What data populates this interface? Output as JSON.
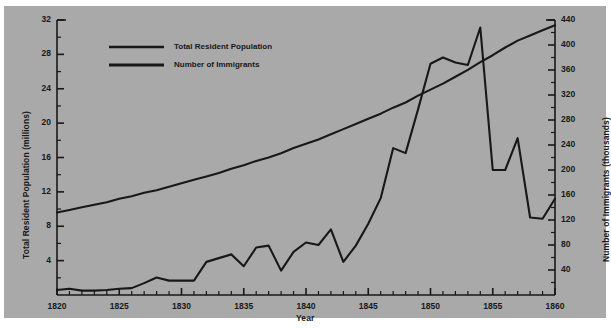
{
  "figure": {
    "background_color": "#ffffff",
    "plate_color": "#a9a9a9",
    "ink_color": "#18181a"
  },
  "chart_data": {
    "type": "line",
    "title": "",
    "xlabel": "Year",
    "ylabel": "Total Resident Population (millions)",
    "y2label": "Number of Immigrants (thousands)",
    "xlim": [
      1820,
      1860
    ],
    "ylim": [
      0,
      32
    ],
    "y2lim": [
      0,
      440
    ],
    "xticks": [
      1820,
      1825,
      1830,
      1835,
      1840,
      1845,
      1850,
      1855,
      1860
    ],
    "xtick_labels": [
      "1820",
      "1825",
      "1830",
      "1835",
      "1840",
      "1845",
      "1850",
      "1855",
      "1860"
    ],
    "xminor_step": 1,
    "yticks": [
      4,
      8,
      12,
      16,
      20,
      24,
      28,
      32
    ],
    "ytick_labels": [
      "4",
      "8",
      "12",
      "16",
      "20",
      "24",
      "28",
      "32"
    ],
    "yminor_step": 2,
    "y2ticks": [
      40,
      80,
      120,
      160,
      200,
      240,
      280,
      320,
      360,
      400,
      440
    ],
    "y2tick_labels": [
      "40",
      "80",
      "120",
      "160",
      "200",
      "240",
      "280",
      "320",
      "360",
      "400",
      "440"
    ],
    "y2minor_step": 20,
    "grid": false,
    "legend_position": "upper-left-inside",
    "x": [
      1820,
      1821,
      1822,
      1823,
      1824,
      1825,
      1826,
      1827,
      1828,
      1829,
      1830,
      1831,
      1832,
      1833,
      1834,
      1835,
      1836,
      1837,
      1838,
      1839,
      1840,
      1841,
      1842,
      1843,
      1844,
      1845,
      1846,
      1847,
      1848,
      1849,
      1850,
      1851,
      1852,
      1853,
      1854,
      1855,
      1856,
      1857,
      1858,
      1859,
      1860
    ],
    "series": [
      {
        "name": "Total Resident Population",
        "axis": "left",
        "unit": "millions",
        "values": [
          9.6,
          9.9,
          10.2,
          10.5,
          10.8,
          11.2,
          11.5,
          11.9,
          12.2,
          12.6,
          13.0,
          13.4,
          13.8,
          14.2,
          14.7,
          15.1,
          15.6,
          16.0,
          16.5,
          17.1,
          17.6,
          18.1,
          18.7,
          19.3,
          19.9,
          20.5,
          21.1,
          21.8,
          22.4,
          23.2,
          23.9,
          24.6,
          25.4,
          26.2,
          27.1,
          27.9,
          28.8,
          29.6,
          30.2,
          30.8,
          31.4
        ]
      },
      {
        "name": "Number of Immigrants",
        "axis": "right",
        "unit": "thousands",
        "values": [
          8,
          10,
          7,
          7,
          8,
          10,
          11,
          19,
          28,
          23,
          23,
          23,
          53,
          59,
          65,
          46,
          76,
          79,
          39,
          69,
          84,
          80,
          105,
          53,
          79,
          114,
          155,
          235,
          227,
          297,
          370,
          380,
          372,
          368,
          428,
          200,
          200,
          251,
          124,
          122,
          154
        ]
      }
    ],
    "legend_entries": [
      "Total Resident Population",
      "Number of Immigrants"
    ]
  }
}
